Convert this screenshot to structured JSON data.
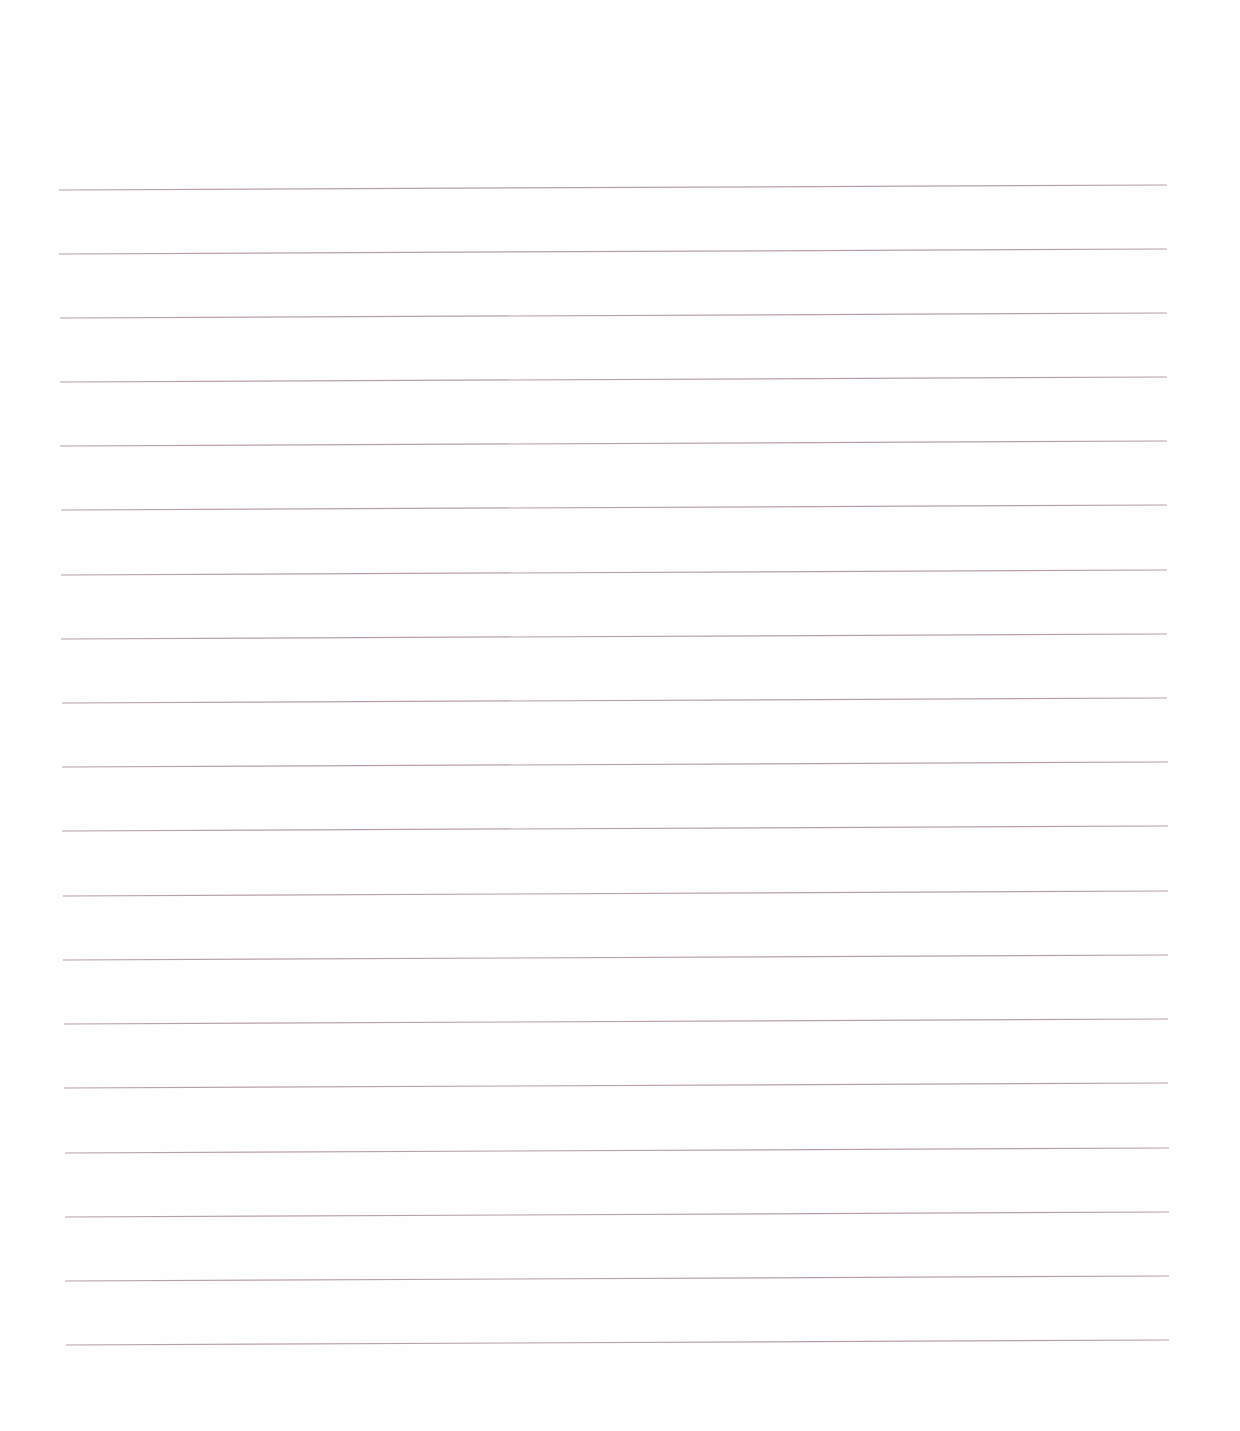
{
  "page": {
    "type": "blank-lined-paper",
    "width": 1240,
    "height": 1431,
    "background_color": "#fefefe"
  },
  "ruling": {
    "line_color": "#b8a0aa",
    "line_thickness": 1.2,
    "line_count": 19,
    "lines": [
      {
        "x1": 59,
        "y1": 190,
        "x2": 1167,
        "y2": 185
      },
      {
        "x1": 59,
        "y1": 254,
        "x2": 1167,
        "y2": 249
      },
      {
        "x1": 60,
        "y1": 318,
        "x2": 1167,
        "y2": 313
      },
      {
        "x1": 60,
        "y1": 382,
        "x2": 1167,
        "y2": 377
      },
      {
        "x1": 60,
        "y1": 446,
        "x2": 1167,
        "y2": 441
      },
      {
        "x1": 61,
        "y1": 510,
        "x2": 1167,
        "y2": 505
      },
      {
        "x1": 61,
        "y1": 575,
        "x2": 1167,
        "y2": 570
      },
      {
        "x1": 61,
        "y1": 639,
        "x2": 1167,
        "y2": 634
      },
      {
        "x1": 62,
        "y1": 703,
        "x2": 1167,
        "y2": 698
      },
      {
        "x1": 62,
        "y1": 767,
        "x2": 1168,
        "y2": 762
      },
      {
        "x1": 62,
        "y1": 831,
        "x2": 1168,
        "y2": 826
      },
      {
        "x1": 63,
        "y1": 896,
        "x2": 1168,
        "y2": 891
      },
      {
        "x1": 63,
        "y1": 960,
        "x2": 1168,
        "y2": 955
      },
      {
        "x1": 64,
        "y1": 1024,
        "x2": 1168,
        "y2": 1019
      },
      {
        "x1": 64,
        "y1": 1088,
        "x2": 1168,
        "y2": 1083
      },
      {
        "x1": 65,
        "y1": 1153,
        "x2": 1169,
        "y2": 1148
      },
      {
        "x1": 65,
        "y1": 1217,
        "x2": 1169,
        "y2": 1212
      },
      {
        "x1": 65,
        "y1": 1281,
        "x2": 1169,
        "y2": 1276
      },
      {
        "x1": 66,
        "y1": 1345,
        "x2": 1169,
        "y2": 1340
      }
    ]
  }
}
